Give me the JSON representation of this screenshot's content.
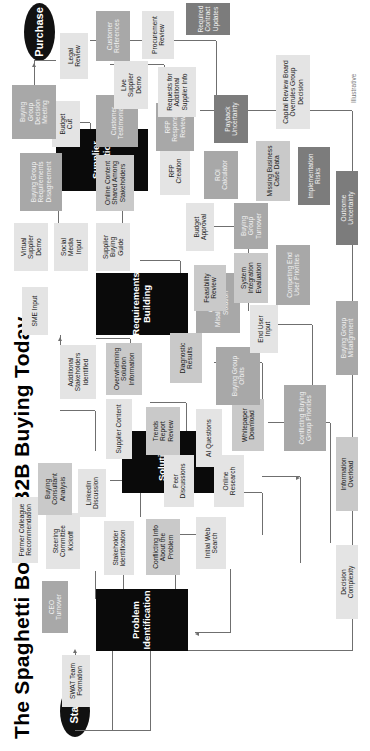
{
  "title": "The Spaghetti Bowl of B2B Buying Today",
  "footnote": "Illustrative",
  "terminals": {
    "start": "Start",
    "end": "Purchase"
  },
  "legend": {
    "items": [
      {
        "label": "Decision\nComplexity",
        "tone": "t1",
        "color": "#e4e4e4"
      },
      {
        "label": "Information\nOverload",
        "tone": "t2",
        "color": "#c9c9c9"
      },
      {
        "label": "Buying Group\nMisalignment",
        "tone": "t3",
        "color": "#a8a8a8"
      },
      {
        "label": "Outcome\nUncertainty",
        "tone": "t4",
        "color": "#7c7c7c"
      }
    ]
  },
  "stages": [
    {
      "id": "stage-problem-identification",
      "label": "Problem\nIdentification"
    },
    {
      "id": "stage-solution-exploration",
      "label": "Solution\nExploration"
    },
    {
      "id": "stage-requirements-building",
      "label": "Requirements\nBuilding"
    },
    {
      "id": "stage-supplier-selection",
      "label": "Supplier\nSelection"
    }
  ],
  "nodes": [
    {
      "id": "n-ceo-turnover",
      "label": "CEO\nTurnover",
      "tone": "t3"
    },
    {
      "id": "n-swat-team-formation",
      "label": "SWAT Team\nFormation",
      "tone": "t1"
    },
    {
      "id": "n-stakeholder-identification",
      "label": "Stakeholder\nIdentification",
      "tone": "t1"
    },
    {
      "id": "n-initial-web-search",
      "label": "Initial Web\nSearch",
      "tone": "t1"
    },
    {
      "id": "n-conflicting-info-about-the-problem",
      "label": "Conflicting Info\nAbout the\nProblem",
      "tone": "t2"
    },
    {
      "id": "n-online-research",
      "label": "Online\nResearch",
      "tone": "t1"
    },
    {
      "id": "n-peer-discussions",
      "label": "Peer\nDiscussions",
      "tone": "t1"
    },
    {
      "id": "n-whitepaper-download",
      "label": "Whitepaper\nDownload",
      "tone": "t2"
    },
    {
      "id": "n-conflicting-buying-group-priorities",
      "label": "Conflicting Buying\nGroup Priorities",
      "tone": "t3"
    },
    {
      "id": "n-steering-committee-kickoff",
      "label": "Steering\nCommittee\nKickoff",
      "tone": "t1"
    },
    {
      "id": "n-linkedin-discussion",
      "label": "LinkedIn\nDiscussion",
      "tone": "t1"
    },
    {
      "id": "n-buying-consultant-analysis",
      "label": "Buying\nConsultant\nAnalysis",
      "tone": "t2"
    },
    {
      "id": "n-former-colleague-recommendation",
      "label": "Former Colleague\nRecommendation",
      "tone": "t1"
    },
    {
      "id": "n-ai-questions",
      "label": "AI Questions",
      "tone": "t1"
    },
    {
      "id": "n-trends-report-review",
      "label": "Trends\nReport\nReview",
      "tone": "t2"
    },
    {
      "id": "n-supplier-content",
      "label": "Supplier Content",
      "tone": "t1"
    },
    {
      "id": "n-overwhelming-solution-information",
      "label": "Overwhelming\nSolution\nInformation",
      "tone": "t2"
    },
    {
      "id": "n-buying-group-orbits",
      "label": "Buying Group\nOrbits",
      "tone": "t3"
    },
    {
      "id": "n-diagnostic-results",
      "label": "Diagnostic\nResults",
      "tone": "t2"
    },
    {
      "id": "n-additional-stakeholders-identified",
      "label": "Additional\nStakeholders\nIdentified",
      "tone": "t1"
    },
    {
      "id": "n-sme-input",
      "label": "SME Input",
      "tone": "t1"
    },
    {
      "id": "n-group-misalignment-on-solution",
      "label": "Group\nMisalignment on\nSolution",
      "tone": "t3"
    },
    {
      "id": "n-system-integration-evaluation",
      "label": "System\nIntegration\nEvaluation",
      "tone": "t2"
    },
    {
      "id": "n-competing-end-user-priorities",
      "label": "Competing End\nUser Priorities",
      "tone": "t3"
    },
    {
      "id": "n-buying-group-turnover",
      "label": "Buying\nGroup\nTurnover",
      "tone": "t3"
    },
    {
      "id": "n-feasibility-review",
      "label": "Feasibility\nReview",
      "tone": "t2"
    },
    {
      "id": "n-end-user-input",
      "label": "End User\nInput",
      "tone": "t1"
    },
    {
      "id": "n-budget-approval",
      "label": "Budget\nApproval",
      "tone": "t1"
    },
    {
      "id": "n-supplier-buying-guide",
      "label": "Supplier\nBuying\nGuide",
      "tone": "t1"
    },
    {
      "id": "n-social-media-input",
      "label": "Social\nMedia\nInput",
      "tone": "t1"
    },
    {
      "id": "n-virtual-supplier-demo",
      "label": "Virtual\nSupplier\nDemo",
      "tone": "t1"
    },
    {
      "id": "n-online-content-shared-among-stakeholders",
      "label": "Online Content\nShared Among\nStakeholders",
      "tone": "t2"
    },
    {
      "id": "n-buying-group-requirements-disagreement",
      "label": "Buying Group\nRequirements\nDisagreement",
      "tone": "t3"
    },
    {
      "id": "n-customer-testimonials",
      "label": "Customer\nTestimonials",
      "tone": "t3"
    },
    {
      "id": "n-budget-cut",
      "label": "Budget\nCut",
      "tone": "t1"
    },
    {
      "id": "n-rfp-creation",
      "label": "RFP\nCreation",
      "tone": "t1"
    },
    {
      "id": "n-rfp-response-review",
      "label": "RFP\nResponse\nReview",
      "tone": "t3"
    },
    {
      "id": "n-roi-calculator",
      "label": "ROI\nCalculator",
      "tone": "t3"
    },
    {
      "id": "n-payback-uncertainty",
      "label": "Payback\nUncertainty",
      "tone": "t4"
    },
    {
      "id": "n-missing-business-case-data",
      "label": "Missing Business\nCase Data",
      "tone": "t2"
    },
    {
      "id": "n-implementation-risks",
      "label": "Implementation\nRisks",
      "tone": "t4"
    },
    {
      "id": "n-capital-review-board-overrules-group-decision",
      "label": "Capital Review Board\nOverrules Group\nDecision",
      "tone": "t1"
    },
    {
      "id": "n-requests-for-additional-supplier-info",
      "label": "Requests for\nAdditional\nSupplier Info",
      "tone": "t1"
    },
    {
      "id": "n-live-supplier-demo",
      "label": "Live\nSupplier\nDemo",
      "tone": "t1"
    },
    {
      "id": "n-procurement-review",
      "label": "Procurement\nReview",
      "tone": "t1"
    },
    {
      "id": "n-customer-references",
      "label": "Customer\nReferences",
      "tone": "t3"
    },
    {
      "id": "n-legal-review",
      "label": "Legal\nReview",
      "tone": "t1"
    },
    {
      "id": "n-required-contract-updates",
      "label": "Required\nContract\nUpdates",
      "tone": "t4"
    },
    {
      "id": "n-buying-group-decision-meeting",
      "label": "Buying\nGroup\nDecision\nMeeting",
      "tone": "t3"
    }
  ]
}
